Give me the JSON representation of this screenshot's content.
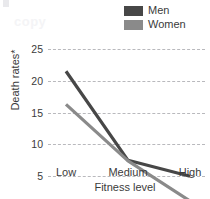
{
  "watermark": {
    "text": "copy"
  },
  "legend": {
    "position": "top-right",
    "entries": [
      {
        "label": "Men",
        "color": "#474747"
      },
      {
        "label": "Women",
        "color": "#8a8a8a"
      }
    ]
  },
  "axes": {
    "ylabel": "Death rates*",
    "xlabel": "Fitness level",
    "yticks": [
      "25",
      "20",
      "15",
      "10",
      "5",
      "0"
    ],
    "xticks": [
      "Low",
      "Medium",
      "High"
    ]
  },
  "chart_data": {
    "type": "line",
    "title": "",
    "xlabel": "Fitness level",
    "ylabel": "Death rates*",
    "categories": [
      "Low",
      "Medium",
      "High"
    ],
    "series": [
      {
        "name": "Men",
        "color": "#474747",
        "values": [
          21.5,
          7.5,
          5.0
        ]
      },
      {
        "name": "Women",
        "color": "#8a8a8a",
        "values": [
          16.3,
          7.4,
          1.1
        ]
      }
    ],
    "ylim": [
      0,
      25
    ],
    "ytick_values": [
      0,
      5,
      10,
      15,
      20,
      25
    ],
    "grid": "horizontal-dashed",
    "legend_position": "top-right"
  }
}
